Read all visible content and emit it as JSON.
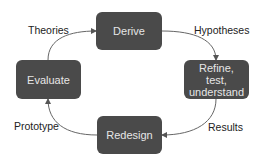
{
  "diagram": {
    "type": "cycle",
    "colors": {
      "box_fill": "#4a4a4a",
      "box_text": "#e6e6e6",
      "edge": "#555555",
      "label_text": "#222222"
    },
    "nodes": [
      {
        "id": "derive",
        "label": "Derive"
      },
      {
        "id": "refine",
        "label": "Refine, test, understand",
        "lines": [
          "Refine,",
          "test,",
          "understand"
        ]
      },
      {
        "id": "redesign",
        "label": "Redesign"
      },
      {
        "id": "evaluate",
        "label": "Evaluate"
      }
    ],
    "edges": [
      {
        "from": "evaluate",
        "to": "derive",
        "label": "Theories"
      },
      {
        "from": "derive",
        "to": "refine",
        "label": "Hypotheses"
      },
      {
        "from": "refine",
        "to": "redesign",
        "label": "Results"
      },
      {
        "from": "redesign",
        "to": "evaluate",
        "label": "Prototype"
      }
    ]
  }
}
